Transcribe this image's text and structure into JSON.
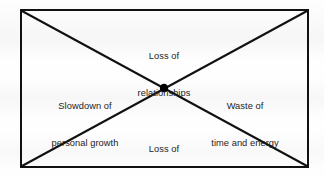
{
  "diagram": {
    "type": "x-cross-quadrant-diagram",
    "shape": "rectangle-with-diagonals",
    "center_marker": "filled-dot",
    "colors": {
      "background": "#fefefe",
      "stroke": "#111111",
      "text": "#1d1d1d",
      "center_dot": "#000000"
    },
    "geometry": {
      "rect_left": 21,
      "rect_top": 10,
      "rect_right": 308,
      "rect_bottom": 167,
      "center_x": 164,
      "center_y": 88,
      "center_dot_radius": 4.2,
      "stroke_width": 2
    },
    "labels": {
      "top": {
        "line1": "Loss of",
        "line2": "relationships"
      },
      "left": {
        "line1": "Slowdown of",
        "line2": "personal growth"
      },
      "right": {
        "line1": "Waste of",
        "line2": "time and energy"
      },
      "bottom": {
        "line1": "Loss of",
        "line2": "sense of identity"
      }
    }
  }
}
